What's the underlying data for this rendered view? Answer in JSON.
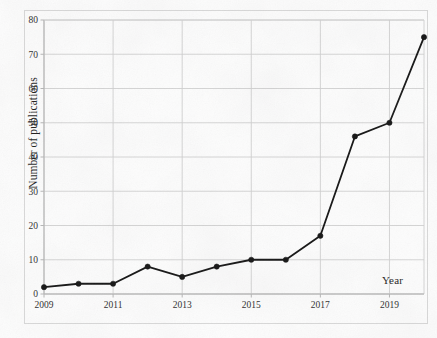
{
  "figure": {
    "background_color": "#fdfdfd",
    "frame_color": "#d8d8d8",
    "gridline_color": "#cfcfcf",
    "axis_color": "#b5b5b5",
    "series_color": "#111111"
  },
  "chart_data": {
    "type": "line",
    "title": "",
    "subtitle": "",
    "xlabel": "Year",
    "ylabel": "Number of publications",
    "categories": [
      2009,
      2010,
      2011,
      2012,
      2013,
      2014,
      2015,
      2016,
      2017,
      2018,
      2019,
      2020
    ],
    "x": [
      2009,
      2010,
      2011,
      2012,
      2013,
      2014,
      2015,
      2016,
      2017,
      2018,
      2019,
      2020
    ],
    "values": [
      2,
      3,
      3,
      8,
      5,
      8,
      10,
      10,
      17,
      46,
      50,
      75
    ],
    "series": [
      {
        "name": "Number of publications",
        "values": [
          2,
          3,
          3,
          8,
          5,
          8,
          10,
          10,
          17,
          46,
          50,
          75
        ],
        "color": "#111111",
        "marker": "circle",
        "line_width": 1.8
      }
    ],
    "xlim": [
      2009,
      2020
    ],
    "ylim": [
      0,
      80
    ],
    "y_ticks": [
      0,
      10,
      20,
      30,
      40,
      50,
      60,
      70,
      80
    ],
    "y_tick_labels": [
      "0",
      "10",
      "20",
      "30",
      "40",
      "50",
      "60",
      "70",
      "80"
    ],
    "x_ticks": [
      2009,
      2011,
      2013,
      2015,
      2017,
      2019
    ],
    "x_tick_labels": [
      "2009",
      "2011",
      "2013",
      "2015",
      "2017",
      "2019"
    ],
    "grid": true,
    "grid_axis": "both",
    "legend": false,
    "legend_position": "none",
    "annotations": []
  },
  "axes": {
    "y_title": "Number of publications",
    "x_title": "Year"
  }
}
